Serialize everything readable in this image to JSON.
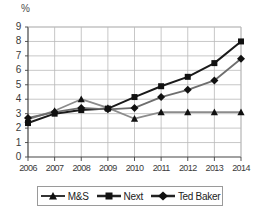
{
  "chart_data": {
    "type": "line",
    "title": "",
    "xlabel": "",
    "ylabel": "%",
    "categories": [
      "2006",
      "2007",
      "2008",
      "2009",
      "2010",
      "2011",
      "2012",
      "2013",
      "2014"
    ],
    "x": [
      2006,
      2007,
      2008,
      2009,
      2010,
      2011,
      2012,
      2013,
      2014
    ],
    "ylim": [
      0,
      9
    ],
    "xlim": [
      2006,
      2014
    ],
    "grid": true,
    "legend_position": "bottom",
    "y_ticks": [
      "0",
      "1",
      "2",
      "3",
      "4",
      "5",
      "6",
      "7",
      "8",
      "9"
    ],
    "series": [
      {
        "name": "M&S",
        "marker": "triangle",
        "color": "#8c8c8c",
        "values": [
          2.6,
          3.2,
          4.0,
          3.4,
          2.65,
          3.1,
          3.1,
          3.1,
          3.1
        ]
      },
      {
        "name": "Next",
        "marker": "square",
        "color": "#1a1a1a",
        "values": [
          2.35,
          3.0,
          3.25,
          3.35,
          4.15,
          4.9,
          5.55,
          6.5,
          8.0
        ]
      },
      {
        "name": "Ted Baker",
        "marker": "diamond",
        "color": "#6e6e6e",
        "values": [
          2.7,
          3.1,
          3.4,
          3.3,
          3.4,
          4.15,
          4.65,
          5.3,
          6.8
        ]
      }
    ]
  },
  "axis": {
    "unit_label": "%"
  },
  "legend": {
    "items": [
      {
        "label": "M&S"
      },
      {
        "label": "Next"
      },
      {
        "label": "Ted Baker"
      }
    ]
  }
}
